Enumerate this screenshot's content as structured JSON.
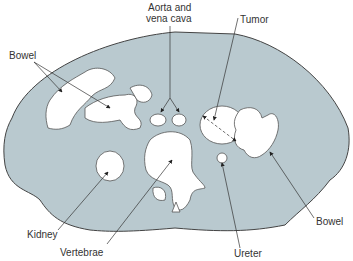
{
  "diagram": {
    "colors": {
      "body": "#b9c9cf",
      "outline": "#444444",
      "organ": "#ffffff",
      "line": "#333333"
    },
    "labels": {
      "bowel_left": "Bowel",
      "aorta_line1": "Aorta and",
      "aorta_line2": "vena cava",
      "tumor": "Tumor",
      "kidney": "Kidney",
      "vertebrae": "Vertebrae",
      "ureter": "Ureter",
      "bowel_right": "Bowel"
    }
  }
}
